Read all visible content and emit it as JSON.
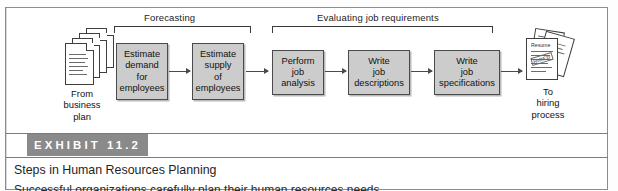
{
  "exhibit": {
    "band_label": "EXHIBIT 11.2",
    "band_color": "#8a8a8a",
    "caption": "Steps in Human Resources Planning",
    "subcaption": "Successful organizations carefully plan their human resources needs."
  },
  "diagram": {
    "groups": [
      {
        "label": "Forecasting"
      },
      {
        "label": "Evaluating job requirements"
      }
    ],
    "start_icon": "document-stack-icon",
    "start_caption": [
      "From",
      "business",
      "plan"
    ],
    "end_icon": "resume-stack-icon",
    "end_caption": [
      "To",
      "hiring",
      "process"
    ],
    "resume_title": "Resume",
    "resume_stamp": "HIRED",
    "box_fill": "#cccccc",
    "box_border": "#4a4a4a",
    "steps": [
      {
        "name": "estimate-demand",
        "lines": [
          "Estimate",
          "demand",
          "for",
          "employees"
        ]
      },
      {
        "name": "estimate-supply",
        "lines": [
          "Estimate",
          "supply",
          "of",
          "employees"
        ]
      },
      {
        "name": "perform-job-analysis",
        "lines": [
          "Perform",
          "job",
          "analysis"
        ]
      },
      {
        "name": "write-job-descriptions",
        "lines": [
          "Write",
          "job",
          "descriptions"
        ]
      },
      {
        "name": "write-job-specifications",
        "lines": [
          "Write",
          "job",
          "specifications"
        ]
      }
    ]
  }
}
